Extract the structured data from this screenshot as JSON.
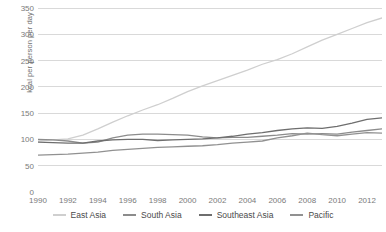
{
  "chart_data": {
    "type": "line",
    "title": "",
    "xlabel": "",
    "ylabel": "kcal per person per day",
    "xlim": [
      1990,
      2013
    ],
    "ylim": [
      0,
      350
    ],
    "grid": true,
    "legend_position": "bottom",
    "x": [
      1990,
      1991,
      1992,
      1993,
      1994,
      1995,
      1996,
      1997,
      1998,
      1999,
      2000,
      2001,
      2002,
      2003,
      2004,
      2005,
      2006,
      2007,
      2008,
      2009,
      2010,
      2011,
      2012,
      2013
    ],
    "xticks": [
      "1990",
      "1992",
      "1994",
      "1996",
      "1998",
      "2000",
      "2002",
      "2004",
      "2006",
      "2008",
      "2010",
      "2012"
    ],
    "yticks": [
      "0",
      "50",
      "100",
      "150",
      "200",
      "250",
      "300",
      "350"
    ],
    "series": [
      {
        "name": "East Asia",
        "color": "#cfcfcf",
        "values": [
          97,
          99,
          101,
          108,
          120,
          133,
          145,
          156,
          166,
          178,
          191,
          202,
          212,
          222,
          232,
          243,
          252,
          263,
          276,
          289,
          300,
          311,
          322,
          331
        ]
      },
      {
        "name": "South Asia",
        "color": "#8c8c8c",
        "values": [
          100,
          99,
          97,
          93,
          95,
          103,
          108,
          110,
          110,
          109,
          108,
          105,
          103,
          104,
          104,
          106,
          108,
          111,
          110,
          111,
          110,
          114,
          117,
          120
        ]
      },
      {
        "name": "Southeast Asia",
        "color": "#6e6e6e",
        "values": [
          95,
          94,
          93,
          93,
          97,
          99,
          100,
          100,
          98,
          99,
          100,
          101,
          103,
          106,
          110,
          113,
          117,
          120,
          122,
          121,
          125,
          131,
          138,
          141
        ]
      },
      {
        "name": "Pacific",
        "color": "#919191",
        "values": [
          70,
          71,
          72,
          74,
          76,
          79,
          81,
          83,
          85,
          86,
          87,
          88,
          90,
          93,
          95,
          97,
          103,
          107,
          112,
          109,
          107,
          110,
          113,
          112
        ]
      }
    ]
  },
  "legend": {
    "items": [
      {
        "label": "East Asia",
        "color": "#cfcfcf"
      },
      {
        "label": "South Asia",
        "color": "#8c8c8c"
      },
      {
        "label": "Southeast Asia",
        "color": "#6e6e6e"
      },
      {
        "label": "Pacific",
        "color": "#919191"
      }
    ]
  },
  "axis": {
    "gridline_color": "#d9d9d9",
    "tick_text_color": "#7a7a7a"
  }
}
